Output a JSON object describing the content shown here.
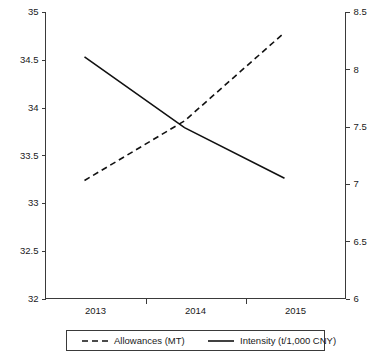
{
  "chart_data": {
    "type": "line",
    "title": "",
    "xlabel": "",
    "categories": [
      "2013",
      "2014",
      "2015"
    ],
    "x": [
      2013,
      2014,
      2015
    ],
    "grid": false,
    "legend_position": "bottom",
    "series": [
      {
        "name": "Allowances (MT)",
        "axis": "right",
        "style": "dashed",
        "values": [
          7.03,
          7.55,
          8.32
        ]
      },
      {
        "name": "Intensity (t/1,000 CNY)",
        "axis": "left",
        "style": "solid",
        "values": [
          34.53,
          33.79,
          33.26
        ]
      }
    ],
    "left_axis": {
      "label": "",
      "ylim": [
        32,
        35
      ],
      "ticks": [
        32,
        32.5,
        33,
        33.5,
        34,
        34.5,
        35
      ],
      "tick_labels": [
        "32",
        "32.5",
        "33",
        "33.5",
        "34",
        "34.5",
        "35"
      ]
    },
    "right_axis": {
      "label": "",
      "ylim": [
        6,
        8.5
      ],
      "ticks": [
        6,
        6.5,
        7,
        7.5,
        8,
        8.5
      ],
      "tick_labels": [
        "6",
        "6.5",
        "7",
        "7.5",
        "8",
        "8.5"
      ]
    },
    "legend": [
      {
        "label": "Allowances (MT)",
        "style": "dashed"
      },
      {
        "label": "Intensity (t/1,000 CNY)",
        "style": "solid"
      }
    ],
    "colors": {
      "series_line": "#111111",
      "axis": "#3a3a3a",
      "background": "#ffffff"
    }
  }
}
